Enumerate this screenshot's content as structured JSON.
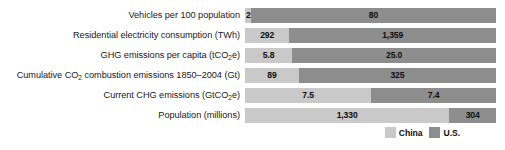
{
  "chart_data": {
    "type": "bar",
    "subtype": "stacked-horizontal-100pct",
    "title": "",
    "xlabel": "",
    "ylabel": "",
    "grid": false,
    "legend_position": "bottom-right",
    "categories": [
      "Vehicles per 100 population",
      "Residential electricity consumption (TWh)",
      "GHG emissions per capita (tCO2e)",
      "Cumulative CO2 combustion emissions 1850–2004 (Gt)",
      "Current CHG emissions (GtCO2e)",
      "Population (millions)"
    ],
    "series": [
      {
        "name": "China",
        "color": "#c9c9c9",
        "values": [
          2,
          292,
          5.8,
          89,
          7.5,
          1330
        ],
        "labels": [
          "2",
          "292",
          "5.8",
          "89",
          "7.5",
          "1,330"
        ]
      },
      {
        "name": "U.S.",
        "color": "#8d8d8d",
        "values": [
          80,
          1359,
          25.0,
          325,
          7.4,
          304
        ],
        "labels": [
          "80",
          "1,359",
          "25.0",
          "325",
          "7.4",
          "304"
        ]
      }
    ]
  },
  "rows": [
    {
      "label_parts": [
        {
          "t": "Vehicles per 100 population"
        }
      ],
      "china_label": "2",
      "us_label": "80",
      "china_pct": 2.44,
      "us_pct": 97.56,
      "china_narrow": true,
      "us_narrow": false
    },
    {
      "label_parts": [
        {
          "t": "Residential electricity consumption (TWh)"
        }
      ],
      "china_label": "292",
      "us_label": "1,359",
      "china_pct": 17.69,
      "us_pct": 82.31,
      "china_narrow": false,
      "us_narrow": false
    },
    {
      "label_parts": [
        {
          "t": "GHG emissions per capita (tCO"
        },
        {
          "t": "2",
          "sub": true
        },
        {
          "t": "e)"
        }
      ],
      "china_label": "5.8",
      "us_label": "25.0",
      "china_pct": 18.83,
      "us_pct": 81.17,
      "china_narrow": false,
      "us_narrow": false
    },
    {
      "label_parts": [
        {
          "t": "Cumulative CO"
        },
        {
          "t": "2",
          "sub": true
        },
        {
          "t": " combustion emissions 1850–2004 (Gt)"
        }
      ],
      "china_label": "89",
      "us_label": "325",
      "china_pct": 21.5,
      "us_pct": 78.5,
      "china_narrow": false,
      "us_narrow": false
    },
    {
      "label_parts": [
        {
          "t": "Current CHG emissions (GtCO"
        },
        {
          "t": "2",
          "sub": true
        },
        {
          "t": "e)"
        }
      ],
      "china_label": "7.5",
      "us_label": "7.4",
      "china_pct": 50.34,
      "us_pct": 49.66,
      "china_narrow": false,
      "us_narrow": false
    },
    {
      "label_parts": [
        {
          "t": "Population (millions)"
        }
      ],
      "china_label": "1,330",
      "us_label": "304",
      "china_pct": 81.4,
      "us_pct": 18.6,
      "china_narrow": false,
      "us_narrow": false
    }
  ],
  "legend": {
    "items": [
      {
        "label": "China",
        "color": "#c9c9c9"
      },
      {
        "label": "U.S.",
        "color": "#8d8d8d"
      }
    ]
  }
}
